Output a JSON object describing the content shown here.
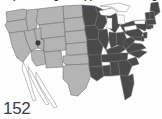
{
  "figure": {
    "number_label": "152",
    "cropped_title": "Map showing the approximate range",
    "background_color": "#fefefe"
  },
  "map": {
    "name": "united-states-choropleth",
    "projection_note": "contiguous United States",
    "border_color": "#6b6b6b",
    "lake_color": "#fdfdfd",
    "categories": [
      {
        "key": "present",
        "label": "Present",
        "color": "#4a4a4a"
      },
      {
        "key": "absent",
        "label": "Absent",
        "color": "#b4b4b4"
      },
      {
        "key": "outline",
        "label": "Not included",
        "color": "none"
      }
    ]
  },
  "chart_data": {
    "type": "map",
    "title": "Map showing the approximate range",
    "value_field": "status",
    "legend_position": "none",
    "grid": false,
    "regions": [
      {
        "code": "WA",
        "name": "Washington",
        "status": "absent"
      },
      {
        "code": "OR",
        "name": "Oregon",
        "status": "absent"
      },
      {
        "code": "CA",
        "name": "California",
        "status": "absent"
      },
      {
        "code": "NV",
        "name": "Nevada",
        "status": "absent"
      },
      {
        "code": "ID",
        "name": "Idaho",
        "status": "absent"
      },
      {
        "code": "MT",
        "name": "Montana",
        "status": "absent"
      },
      {
        "code": "WY",
        "name": "Wyoming",
        "status": "absent"
      },
      {
        "code": "UT",
        "name": "Utah",
        "status": "absent"
      },
      {
        "code": "AZ",
        "name": "Arizona",
        "status": "absent"
      },
      {
        "code": "CO",
        "name": "Colorado",
        "status": "absent"
      },
      {
        "code": "NM",
        "name": "New Mexico",
        "status": "absent"
      },
      {
        "code": "ND",
        "name": "North Dakota",
        "status": "absent"
      },
      {
        "code": "SD",
        "name": "South Dakota",
        "status": "absent"
      },
      {
        "code": "NE",
        "name": "Nebraska",
        "status": "absent"
      },
      {
        "code": "KS",
        "name": "Kansas",
        "status": "absent"
      },
      {
        "code": "OK",
        "name": "Oklahoma",
        "status": "absent"
      },
      {
        "code": "TX",
        "name": "Texas",
        "status": "absent"
      },
      {
        "code": "MN",
        "name": "Minnesota",
        "status": "present"
      },
      {
        "code": "IA",
        "name": "Iowa",
        "status": "present"
      },
      {
        "code": "MO",
        "name": "Missouri",
        "status": "present"
      },
      {
        "code": "AR",
        "name": "Arkansas",
        "status": "present"
      },
      {
        "code": "LA",
        "name": "Louisiana",
        "status": "present"
      },
      {
        "code": "WI",
        "name": "Wisconsin",
        "status": "present"
      },
      {
        "code": "IL",
        "name": "Illinois",
        "status": "present"
      },
      {
        "code": "MS",
        "name": "Mississippi",
        "status": "present"
      },
      {
        "code": "MI",
        "name": "Michigan",
        "status": "present"
      },
      {
        "code": "IN",
        "name": "Indiana",
        "status": "present"
      },
      {
        "code": "KY",
        "name": "Kentucky",
        "status": "present"
      },
      {
        "code": "TN",
        "name": "Tennessee",
        "status": "present"
      },
      {
        "code": "AL",
        "name": "Alabama",
        "status": "present"
      },
      {
        "code": "OH",
        "name": "Ohio",
        "status": "present"
      },
      {
        "code": "GA",
        "name": "Georgia",
        "status": "present"
      },
      {
        "code": "FL",
        "name": "Florida",
        "status": "present"
      },
      {
        "code": "SC",
        "name": "South Carolina",
        "status": "present"
      },
      {
        "code": "NC",
        "name": "North Carolina",
        "status": "present"
      },
      {
        "code": "VA",
        "name": "Virginia",
        "status": "present"
      },
      {
        "code": "WV",
        "name": "West Virginia",
        "status": "present"
      },
      {
        "code": "MD",
        "name": "Maryland",
        "status": "present"
      },
      {
        "code": "DE",
        "name": "Delaware",
        "status": "present"
      },
      {
        "code": "PA",
        "name": "Pennsylvania",
        "status": "present"
      },
      {
        "code": "NJ",
        "name": "New Jersey",
        "status": "present"
      },
      {
        "code": "NY",
        "name": "New York",
        "status": "present"
      },
      {
        "code": "CT",
        "name": "Connecticut",
        "status": "present"
      },
      {
        "code": "RI",
        "name": "Rhode Island",
        "status": "present"
      },
      {
        "code": "MA",
        "name": "Massachusetts",
        "status": "present"
      },
      {
        "code": "VT",
        "name": "Vermont",
        "status": "present"
      },
      {
        "code": "NH",
        "name": "New Hampshire",
        "status": "present"
      },
      {
        "code": "ME",
        "name": "Maine",
        "status": "present"
      }
    ],
    "markers": [
      {
        "name": "isolated-occurrence",
        "x": 38,
        "y": 43,
        "color": "#3a3a3a"
      }
    ]
  }
}
